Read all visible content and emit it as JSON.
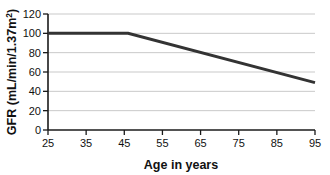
{
  "chart_data": {
    "type": "line",
    "title": "",
    "xlabel": "Age in years",
    "ylabel": "GFR (mL/min/1.37m",
    "ylabel_superscript": "2",
    "ylabel_suffix": ")",
    "ylabel_full": "GFR (mL/min/1.37m2)",
    "x": [
      25,
      46,
      95
    ],
    "values": [
      100,
      100,
      49
    ],
    "series": [
      {
        "name": "GFR",
        "x": [
          25,
          46,
          95
        ],
        "values": [
          100,
          100,
          49
        ],
        "color": "#333333"
      }
    ],
    "xlim": [
      25,
      95
    ],
    "ylim": [
      0,
      120
    ],
    "xticks": [
      "25",
      "35",
      "45",
      "55",
      "65",
      "75",
      "85",
      "95"
    ],
    "xtick_values": [
      25,
      35,
      45,
      55,
      65,
      75,
      85,
      95
    ],
    "yticks": [
      "0",
      "20",
      "40",
      "60",
      "80",
      "100",
      "120"
    ],
    "ytick_values": [
      0,
      20,
      40,
      60,
      80,
      100,
      120
    ],
    "grid": true,
    "grid_axis": "y",
    "grid_color": "#c9c9c9",
    "legend": false,
    "legend_position": "none",
    "axis_color": "#1a1a1a",
    "line_color": "#333333",
    "background": "#ffffff",
    "annotations": []
  }
}
